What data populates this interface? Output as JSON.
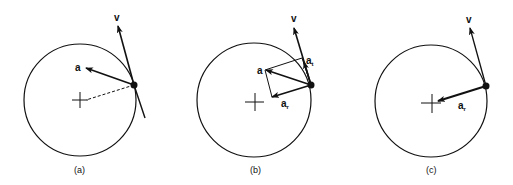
{
  "figure": {
    "panels": [
      {
        "id": "a",
        "caption": "(a)",
        "labels": {
          "velocity": "v",
          "acceleration": "a"
        }
      },
      {
        "id": "b",
        "caption": "(b)",
        "labels": {
          "velocity": "v",
          "acceleration": "a",
          "tangential": "a",
          "tangential_sub": "t",
          "radial": "a",
          "radial_sub": "r"
        }
      },
      {
        "id": "c",
        "caption": "(c)",
        "labels": {
          "velocity": "v",
          "radial": "a",
          "radial_sub": "r"
        }
      }
    ],
    "colors": {
      "stroke": "#111111",
      "background": "#ffffff"
    }
  }
}
